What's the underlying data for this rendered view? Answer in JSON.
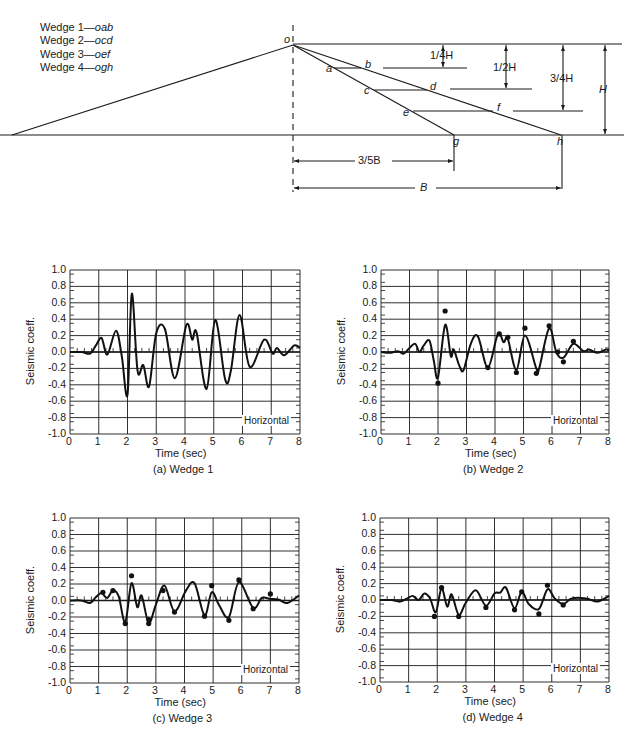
{
  "diagram": {
    "legend": [
      {
        "label": "Wedge 1",
        "points": "oab"
      },
      {
        "label": "Wedge 2",
        "points": "ocd"
      },
      {
        "label": "Wedge 3",
        "points": "oef"
      },
      {
        "label": "Wedge 4",
        "points": "ogh"
      }
    ],
    "point_labels": [
      "o",
      "a",
      "b",
      "c",
      "d",
      "e",
      "f",
      "g",
      "h"
    ],
    "dimensions": {
      "quarter_h": "1/4H",
      "half_h": "1/2H",
      "three_quarter_h": "3/4H",
      "h": "H",
      "three_fifth_b": "3/5B",
      "b": "B"
    }
  },
  "chart_data": [
    {
      "type": "line",
      "title": "(a) Wedge 1",
      "annotation": "Horizontal",
      "xlabel": "Time (sec)",
      "ylabel": "Seismic coeff.",
      "xlim": [
        0,
        8
      ],
      "ylim": [
        -1.0,
        1.0
      ],
      "xticks": [
        "0",
        "1",
        "2",
        "3",
        "4",
        "5",
        "6",
        "7",
        "8"
      ],
      "yticks": [
        "1.0",
        "0.8",
        "0.6",
        "0.4",
        "0.2",
        "0.0",
        "-0.2",
        "-0.4",
        "-0.6",
        "-0.8",
        "-1.0"
      ],
      "grid": true,
      "series": [
        {
          "name": "computed",
          "x": [
            0,
            0.4,
            0.7,
            0.9,
            1.1,
            1.3,
            1.6,
            1.8,
            2.0,
            2.15,
            2.35,
            2.55,
            2.75,
            3.0,
            3.3,
            3.65,
            4.05,
            4.25,
            4.4,
            4.75,
            5.05,
            5.4,
            5.6,
            5.9,
            6.25,
            6.75,
            7.05,
            7.2,
            7.45,
            7.8,
            8.0
          ],
          "y": [
            0.0,
            0.0,
            -0.02,
            0.08,
            0.17,
            -0.03,
            0.26,
            -0.05,
            -0.52,
            0.71,
            -0.23,
            -0.16,
            -0.42,
            0.23,
            0.28,
            -0.32,
            0.33,
            0.15,
            0.24,
            -0.45,
            0.39,
            -0.34,
            -0.22,
            0.45,
            -0.18,
            0.15,
            -0.02,
            0.05,
            -0.04,
            0.08,
            0.05
          ]
        }
      ],
      "markers": []
    },
    {
      "type": "line",
      "title": "(b) Wedge 2",
      "annotation": "Horizontal",
      "xlabel": "Time (sec)",
      "ylabel": "Seismic coeff.",
      "xlim": [
        0,
        8
      ],
      "ylim": [
        -1.0,
        1.0
      ],
      "xticks": [
        "0",
        "1",
        "2",
        "3",
        "4",
        "5",
        "6",
        "7",
        "8"
      ],
      "yticks": [
        "1.0",
        "0.8",
        "0.6",
        "0.4",
        "0.2",
        "0.0",
        "-0.2",
        "-0.4",
        "-0.6",
        "-0.8",
        "-1.0"
      ],
      "grid": true,
      "series": [
        {
          "name": "computed",
          "x": [
            0,
            0.3,
            0.6,
            0.8,
            1.0,
            1.2,
            1.35,
            1.5,
            1.7,
            1.85,
            2.0,
            2.25,
            2.45,
            2.55,
            2.75,
            2.9,
            3.15,
            3.4,
            3.75,
            4.1,
            4.3,
            4.45,
            4.75,
            5.05,
            5.45,
            5.55,
            5.9,
            6.15,
            6.4,
            6.75,
            7.1,
            7.3,
            7.6,
            7.9,
            8.0
          ],
          "y": [
            0.0,
            -0.01,
            0.01,
            -0.02,
            0.05,
            0.1,
            0.0,
            0.08,
            0.14,
            -0.1,
            -0.31,
            0.33,
            -0.05,
            0.03,
            -0.17,
            -0.22,
            0.1,
            0.19,
            -0.19,
            0.22,
            0.12,
            0.16,
            -0.22,
            0.2,
            -0.2,
            -0.2,
            0.29,
            0.0,
            -0.07,
            0.1,
            0.01,
            0.03,
            -0.01,
            0.03,
            0.02
          ]
        }
      ],
      "markers": {
        "x": [
          2.0,
          2.25,
          3.75,
          4.15,
          4.45,
          4.75,
          5.05,
          5.45,
          5.9,
          6.2,
          6.4,
          6.75
        ],
        "y": [
          -0.38,
          0.5,
          -0.19,
          0.22,
          0.18,
          -0.25,
          0.29,
          -0.26,
          0.32,
          0.0,
          -0.12,
          0.13
        ]
      }
    },
    {
      "type": "line",
      "title": "(c) Wedge 3",
      "annotation": "Horizontal",
      "xlabel": "Time (sec)",
      "ylabel": "Seismic coeff.",
      "xlim": [
        0,
        8
      ],
      "ylim": [
        -1.0,
        1.0
      ],
      "xticks": [
        "0",
        "1",
        "2",
        "3",
        "4",
        "5",
        "6",
        "7",
        "8"
      ],
      "yticks": [
        "1.0",
        "0.8",
        "0.6",
        "0.4",
        "0.2",
        "0.0",
        "-0.2",
        "-0.4",
        "-0.6",
        "-0.8",
        "-1.0"
      ],
      "grid": true,
      "series": [
        {
          "name": "computed",
          "x": [
            0,
            0.4,
            0.7,
            0.9,
            1.1,
            1.3,
            1.5,
            1.7,
            1.93,
            2.15,
            2.35,
            2.5,
            2.75,
            3.0,
            3.3,
            3.65,
            4.05,
            4.35,
            4.7,
            4.95,
            5.2,
            5.55,
            5.9,
            6.4,
            6.7,
            7.0,
            7.3,
            7.6,
            8.0
          ],
          "y": [
            0.0,
            0.0,
            -0.03,
            0.04,
            0.09,
            0.03,
            0.12,
            0.05,
            -0.26,
            0.21,
            -0.08,
            0.06,
            -0.27,
            -0.05,
            0.18,
            -0.13,
            0.12,
            0.21,
            -0.18,
            0.1,
            -0.05,
            -0.2,
            0.22,
            -0.09,
            0.03,
            0.02,
            0.01,
            -0.03,
            0.06
          ]
        }
      ],
      "markers": {
        "x": [
          1.15,
          1.5,
          1.93,
          2.15,
          2.75,
          2.75,
          3.25,
          3.65,
          4.7,
          4.95,
          5.55,
          5.9,
          6.4,
          7.0
        ],
        "y": [
          0.1,
          0.12,
          -0.28,
          0.3,
          -0.23,
          -0.28,
          0.12,
          -0.14,
          -0.19,
          0.18,
          -0.24,
          0.25,
          -0.1,
          0.08
        ]
      }
    },
    {
      "type": "line",
      "title": "(d) Wedge 4",
      "annotation": "Horizontal",
      "xlabel": "Time (sec)",
      "ylabel": "Seismic coeff.",
      "xlim": [
        0,
        8
      ],
      "ylim": [
        -1.0,
        1.0
      ],
      "xticks": [
        "0",
        "1",
        "2",
        "3",
        "4",
        "5",
        "6",
        "7",
        "8"
      ],
      "yticks": [
        "1.0",
        "0.8",
        "0.6",
        "0.4",
        "0.2",
        "0.0",
        "-0.2",
        "-0.4",
        "-0.6",
        "-0.8",
        "-1.0"
      ],
      "grid": true,
      "series": [
        {
          "name": "computed",
          "x": [
            0,
            0.4,
            0.7,
            0.95,
            1.15,
            1.35,
            1.55,
            1.75,
            1.95,
            2.15,
            2.35,
            2.5,
            2.75,
            3.0,
            3.35,
            3.7,
            4.0,
            4.2,
            4.4,
            4.7,
            4.95,
            5.2,
            5.55,
            5.85,
            6.1,
            6.4,
            6.7,
            7.2,
            7.6,
            8.0
          ],
          "y": [
            0.0,
            0.0,
            -0.02,
            0.02,
            0.05,
            0.0,
            0.08,
            0.02,
            -0.15,
            0.14,
            -0.08,
            0.07,
            -0.18,
            -0.03,
            0.12,
            -0.07,
            0.08,
            0.09,
            0.15,
            -0.1,
            0.1,
            -0.05,
            -0.11,
            0.13,
            0.02,
            -0.05,
            0.02,
            0.02,
            -0.02,
            0.05
          ]
        }
      ],
      "markers": {
        "x": [
          1.9,
          2.15,
          2.75,
          3.7,
          4.7,
          4.95,
          5.55,
          5.85,
          6.4
        ],
        "y": [
          -0.2,
          0.15,
          -0.2,
          -0.09,
          -0.12,
          0.1,
          -0.17,
          0.18,
          -0.06
        ]
      }
    }
  ]
}
